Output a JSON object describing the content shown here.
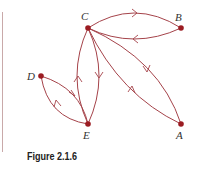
{
  "figure": {
    "caption": "Figure 2.1.6",
    "edge_color": "#a5434a",
    "node_color": "#9b1c22"
  },
  "nodes": [
    {
      "id": "C",
      "label": "C",
      "x": 88,
      "y": 28
    },
    {
      "id": "B",
      "label": "B",
      "x": 181,
      "y": 28
    },
    {
      "id": "D",
      "label": "D",
      "x": 41,
      "y": 76
    },
    {
      "id": "E",
      "label": "E",
      "x": 88,
      "y": 124
    },
    {
      "id": "A",
      "label": "A",
      "x": 181,
      "y": 124
    }
  ],
  "edges": [
    {
      "from": "C",
      "to": "B"
    },
    {
      "from": "B",
      "to": "C"
    },
    {
      "from": "C",
      "to": "A"
    },
    {
      "from": "A",
      "to": "C"
    },
    {
      "from": "C",
      "to": "E"
    },
    {
      "from": "E",
      "to": "C"
    },
    {
      "from": "D",
      "to": "E"
    },
    {
      "from": "E",
      "to": "D"
    }
  ]
}
